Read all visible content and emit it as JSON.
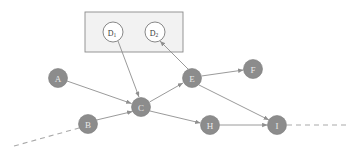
{
  "diagram": {
    "type": "directed-graph",
    "title": "",
    "background_color": "#ffffff",
    "node_fill_color": "#8c8c8c",
    "node_label_color": "#e8e8e8",
    "edge_color": "#8f8f8f",
    "dashed_edge_color": "#a9a9a9",
    "group_box_fill": "#f2f2f2",
    "group_box_stroke": "#8a8a8a",
    "nodes": [
      {
        "id": "A",
        "label": "A",
        "cx": 58,
        "cy": 78,
        "r": 9.5,
        "style": "filled"
      },
      {
        "id": "B",
        "label": "B",
        "cx": 88,
        "cy": 124,
        "r": 9.5,
        "style": "filled"
      },
      {
        "id": "C",
        "label": "C",
        "cx": 141,
        "cy": 107,
        "r": 9.5,
        "style": "filled"
      },
      {
        "id": "E",
        "label": "E",
        "cx": 192,
        "cy": 78,
        "r": 9.5,
        "style": "filled"
      },
      {
        "id": "F",
        "label": "F",
        "cx": 253,
        "cy": 69,
        "r": 9.5,
        "style": "filled"
      },
      {
        "id": "H",
        "label": "H",
        "cx": 210,
        "cy": 125,
        "r": 9.5,
        "style": "filled"
      },
      {
        "id": "I",
        "label": "I",
        "cx": 277,
        "cy": 125,
        "r": 9.5,
        "style": "filled"
      }
    ],
    "boxed_nodes": [
      {
        "id": "D1",
        "label": "D",
        "subscript": "1",
        "cx": 113,
        "cy": 32,
        "r": 10,
        "style": "outlined"
      },
      {
        "id": "D2",
        "label": "D",
        "subscript": "2",
        "cx": 155,
        "cy": 32,
        "r": 10,
        "style": "outlined"
      }
    ],
    "group_box": {
      "x": 85,
      "y": 12,
      "width": 98,
      "height": 40
    },
    "edges": [
      {
        "from": "A",
        "to": "C",
        "arrow": true,
        "style": "solid"
      },
      {
        "from": "B",
        "to": "C",
        "arrow": true,
        "style": "solid"
      },
      {
        "from": "D1",
        "to": "C",
        "arrow": true,
        "style": "solid"
      },
      {
        "from": "C",
        "to": "E",
        "arrow": true,
        "style": "solid"
      },
      {
        "from": "C",
        "to": "H",
        "arrow": true,
        "style": "solid"
      },
      {
        "from": "E",
        "to": "D2",
        "arrow": true,
        "style": "solid"
      },
      {
        "from": "E",
        "to": "F",
        "arrow": true,
        "style": "solid"
      },
      {
        "from": "E",
        "to": "I",
        "arrow": true,
        "style": "solid"
      },
      {
        "from": "H",
        "to": "I",
        "arrow": true,
        "style": "solid"
      }
    ],
    "dashed_edges": [
      {
        "id": "left-tail",
        "x1": 14,
        "y1": 146,
        "x2": 79,
        "y2": 128,
        "arrow": false
      },
      {
        "id": "right-tail",
        "x1": 287,
        "y1": 125,
        "x2": 350,
        "y2": 125,
        "arrow": false
      }
    ]
  }
}
